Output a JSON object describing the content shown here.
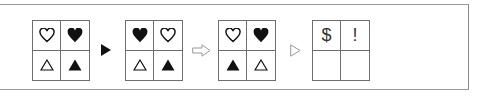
{
  "puzzle": {
    "grids": [
      {
        "cells": [
          "heart-outline",
          "heart-filled",
          "triangle-outline",
          "triangle-filled"
        ]
      },
      {
        "cells": [
          "heart-filled",
          "heart-outline",
          "triangle-outline",
          "triangle-filled"
        ]
      },
      {
        "cells": [
          "heart-outline",
          "heart-filled",
          "triangle-filled",
          "triangle-outline"
        ]
      },
      {
        "cells": [
          "$",
          "!",
          "",
          ""
        ]
      }
    ],
    "arrows": [
      "filled-triangle-arrow",
      "hollow-block-arrow",
      "hollow-triangle-arrow"
    ],
    "colors": {
      "symbol": "#111111",
      "grid_line": "#6e6e6e",
      "frame": "#9a9a9a",
      "arrow_outline": "#999999"
    }
  }
}
